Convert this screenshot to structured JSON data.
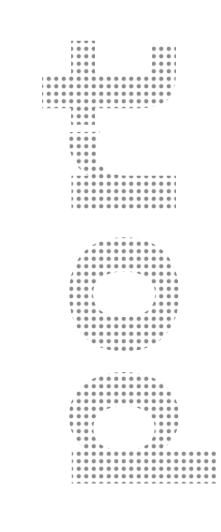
{
  "text": "port",
  "orientation": "rotated-counterclockwise",
  "style": "halftone-dots",
  "colors": {
    "ink": "#8a8a8a",
    "background": "#ffffff"
  }
}
